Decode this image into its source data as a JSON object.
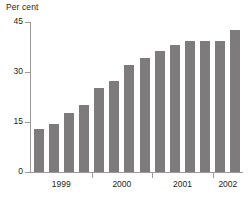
{
  "chart_data": {
    "type": "bar",
    "title": "",
    "subtitle": "",
    "ylabel": "Per cent",
    "xlabel": "",
    "ylim": [
      0,
      45
    ],
    "yticks": [
      0,
      15,
      30,
      45
    ],
    "ytick_labels": [
      "0",
      "15",
      "30",
      "45"
    ],
    "grid": false,
    "legend": "none",
    "bar_color": "#7d7b7c",
    "axis_color": "#9c9a9b",
    "text_color": "#231f20",
    "group_labels": [
      "1999",
      "2000",
      "2001",
      "2002"
    ],
    "group_sizes": [
      4,
      4,
      4,
      2
    ],
    "categories": [
      "1999 Q1",
      "1999 Q2",
      "1999 Q3",
      "1999 Q4",
      "2000 Q1",
      "2000 Q2",
      "2000 Q3",
      "2000 Q4",
      "2001 Q1",
      "2001 Q2",
      "2001 Q3",
      "2001 Q4",
      "2002 Q1",
      "2002 Q2"
    ],
    "values": [
      13.0,
      14.3,
      17.8,
      20.2,
      25.2,
      27.2,
      32.2,
      34.3,
      36.2,
      38.2,
      39.2,
      39.2,
      39.2,
      42.5
    ]
  }
}
